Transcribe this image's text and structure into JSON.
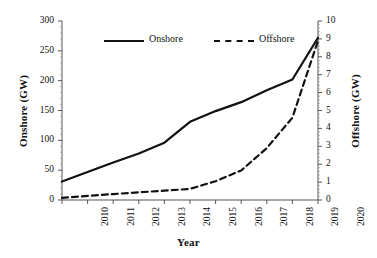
{
  "chart_data": {
    "type": "line",
    "title": "",
    "xlabel": "Year",
    "ylabel": "Onshore (GW)",
    "y2label": "Offshore (GW)",
    "x": [
      2010,
      2011,
      2012,
      2013,
      2014,
      2015,
      2016,
      2017,
      2018,
      2019,
      2020
    ],
    "categories": [
      "2010",
      "2011",
      "2012",
      "2013",
      "2014",
      "2015",
      "2016",
      "2017",
      "2018",
      "2019",
      "2020"
    ],
    "ylim": [
      0,
      300
    ],
    "yticks": [
      0,
      50,
      100,
      150,
      200,
      250,
      300
    ],
    "ytick_labels": [
      "0",
      "50",
      "100",
      "150",
      "200",
      "250",
      "300"
    ],
    "y2lim": [
      0,
      10
    ],
    "y2ticks": [
      0,
      1,
      2,
      3,
      4,
      5,
      6,
      7,
      8,
      9,
      10
    ],
    "y2tick_labels": [
      "0",
      "1",
      "2",
      "3",
      "4",
      "5",
      "6",
      "7",
      "8",
      "9",
      "10"
    ],
    "grid": false,
    "legend_position": "top-center",
    "series": [
      {
        "name": "Onshore",
        "axis": "left",
        "style": "solid",
        "color": "#111111",
        "values": [
          31,
          47,
          63,
          78,
          96,
          131,
          149,
          164,
          184,
          202,
          272
        ]
      },
      {
        "name": "Offshore",
        "axis": "right",
        "style": "dashed",
        "color": "#111111",
        "values": [
          0.12,
          0.23,
          0.33,
          0.43,
          0.52,
          0.62,
          1.05,
          1.65,
          2.9,
          4.6,
          8.9
        ]
      }
    ]
  },
  "legend": {
    "items": [
      {
        "label": "Onshore",
        "style": "solid"
      },
      {
        "label": "Offshore",
        "style": "dashed"
      }
    ]
  },
  "axes": {
    "left_title": "Onshore (GW)",
    "right_title": "Offshore (GW)",
    "x_title": "Year"
  }
}
